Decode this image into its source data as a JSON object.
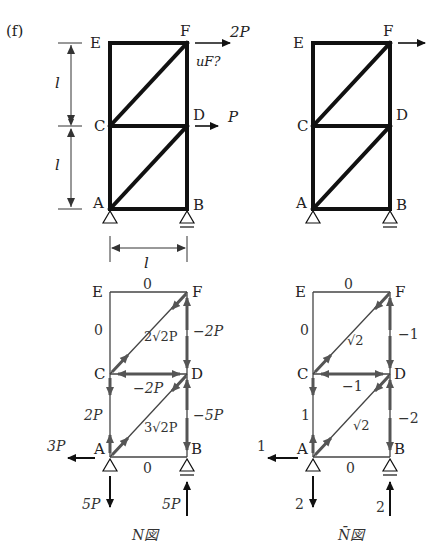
{
  "figure_label": "(f)",
  "top_left": {
    "nodes": {
      "E": "E",
      "F": "F",
      "C": "C",
      "D": "D",
      "A": "A",
      "B": "B"
    },
    "load_F": "2P",
    "load_D": "P",
    "unknown": "uF?",
    "dim_upper": "l",
    "dim_lower": "l",
    "dim_width": "l"
  },
  "top_right": {
    "nodes": {
      "E": "E",
      "F": "F",
      "C": "C",
      "D": "D",
      "A": "A",
      "B": "B"
    }
  },
  "n_diagram": {
    "caption": "N図",
    "nodes": {
      "E": "E",
      "F": "F",
      "C": "C",
      "D": "D",
      "A": "A",
      "B": "B"
    },
    "members": {
      "EF": "0",
      "EC": "0",
      "CF": "2√2P",
      "FD": "−2P",
      "CD": "−2P",
      "CA": "2P",
      "AD": "3√2P",
      "DB": "−5P",
      "AB": "0"
    },
    "reactions": {
      "A_horizontal": "3P",
      "A_vertical": "5P",
      "B_vertical": "5P"
    }
  },
  "nbar_diagram": {
    "caption": "N̄図",
    "nodes": {
      "E": "E",
      "F": "F",
      "C": "C",
      "D": "D",
      "A": "A",
      "B": "B"
    },
    "members": {
      "EF": "0",
      "EC": "0",
      "CF": "√2",
      "FD": "−1",
      "CD": "−1",
      "CA": "1",
      "AD": "√2",
      "DB": "−2",
      "AB": "0"
    },
    "reactions": {
      "A_horizontal": "1",
      "A_vertical": "2",
      "B_vertical": "2"
    }
  }
}
